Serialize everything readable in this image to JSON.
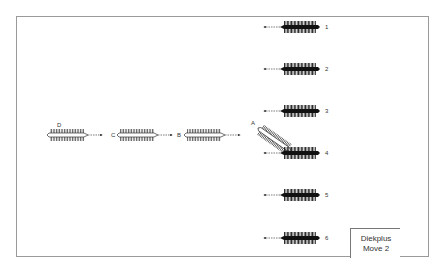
{
  "diagram": {
    "title": "Diekplus",
    "subtitle": "Move 2",
    "colors": {
      "frame": "#9a9a9a",
      "enemy_ship": "#111111",
      "attacking_ship": "#ffffff",
      "oars": "#333333"
    },
    "attacking_ships": [
      {
        "label": "D",
        "x": 47,
        "y": 135,
        "angle": 0
      },
      {
        "label": "C",
        "x": 117,
        "y": 135,
        "angle": 0
      },
      {
        "label": "B",
        "x": 184,
        "y": 135,
        "angle": 0
      },
      {
        "label": "A",
        "x": 258,
        "y": 128,
        "angle": 35
      }
    ],
    "defending_ships": [
      {
        "label": "1",
        "x": 281,
        "y": 27
      },
      {
        "label": "2",
        "x": 281,
        "y": 69
      },
      {
        "label": "3",
        "x": 281,
        "y": 111
      },
      {
        "label": "4",
        "x": 281,
        "y": 153
      },
      {
        "label": "5",
        "x": 281,
        "y": 195
      },
      {
        "label": "6",
        "x": 281,
        "y": 238
      }
    ]
  }
}
